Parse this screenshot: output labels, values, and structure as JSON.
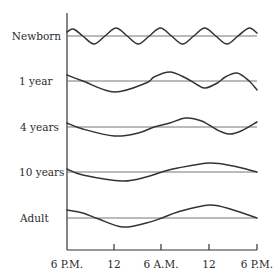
{
  "chart_data": {
    "type": "line",
    "title": "",
    "xlabel": "",
    "ylabel": "",
    "x_tick_labels": [
      "6 P.M.",
      "12",
      "6 A.M.",
      "12",
      "6 P.M."
    ],
    "x_range_hours": [
      0,
      24
    ],
    "grid": false,
    "legend": "none (row labels on left)",
    "rows": [
      {
        "name": "Newborn",
        "description": "High-frequency oscillation, about 4.5 cycles over 24 h",
        "points": [
          [
            0,
            4
          ],
          [
            0.8,
            7
          ],
          [
            2,
            0
          ],
          [
            3.4,
            -8
          ],
          [
            4.8,
            0
          ],
          [
            6.2,
            8
          ],
          [
            7.6,
            0
          ],
          [
            9,
            -8
          ],
          [
            10.4,
            0
          ],
          [
            11.8,
            8
          ],
          [
            13.2,
            0
          ],
          [
            14.6,
            -8
          ],
          [
            16,
            0
          ],
          [
            17.4,
            8
          ],
          [
            18.8,
            0
          ],
          [
            20.2,
            -8
          ],
          [
            21.6,
            0
          ],
          [
            23,
            8
          ],
          [
            24,
            3
          ]
        ]
      },
      {
        "name": "1 year",
        "points": [
          [
            0,
            6
          ],
          [
            2,
            0
          ],
          [
            6,
            -11
          ],
          [
            10,
            -2
          ],
          [
            11,
            4
          ],
          [
            13,
            9
          ],
          [
            15,
            3
          ],
          [
            16.5,
            -4
          ],
          [
            17.5,
            -7
          ],
          [
            19,
            -2
          ],
          [
            20,
            4
          ],
          [
            21.5,
            8
          ],
          [
            23,
            0
          ],
          [
            24,
            -9
          ]
        ]
      },
      {
        "name": "4 years",
        "points": [
          [
            0,
            4
          ],
          [
            2,
            -2
          ],
          [
            6,
            -9
          ],
          [
            9,
            -6
          ],
          [
            11,
            0
          ],
          [
            13,
            4
          ],
          [
            15,
            9
          ],
          [
            17,
            6
          ],
          [
            19,
            -3
          ],
          [
            20.5,
            -7
          ],
          [
            22,
            -4
          ],
          [
            24,
            5
          ]
        ]
      },
      {
        "name": "10 years",
        "points": [
          [
            0,
            3
          ],
          [
            2,
            -3
          ],
          [
            7,
            -9
          ],
          [
            10,
            -5
          ],
          [
            12,
            0
          ],
          [
            14,
            4
          ],
          [
            18,
            9
          ],
          [
            21,
            6
          ],
          [
            24,
            0
          ]
        ]
      },
      {
        "name": "Adult",
        "points": [
          [
            0,
            8
          ],
          [
            2,
            5
          ],
          [
            4,
            -1
          ],
          [
            7,
            -9
          ],
          [
            10,
            -5
          ],
          [
            12,
            0
          ],
          [
            14,
            6
          ],
          [
            18,
            13
          ],
          [
            21,
            8
          ],
          [
            24,
            0
          ]
        ]
      }
    ]
  },
  "labels": {
    "rows": [
      "Newborn",
      "1 year",
      "4 years",
      "10 years",
      "Adult"
    ],
    "ticks": [
      "6 P.M.",
      "12",
      "6 A.M.",
      "12",
      "6 P.M."
    ]
  }
}
